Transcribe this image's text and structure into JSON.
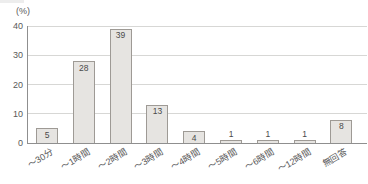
{
  "chart_data": {
    "type": "bar",
    "title": "",
    "unit_label": "(%)",
    "categories": [
      "〜30分",
      "〜1時間",
      "〜2時間",
      "〜3時間",
      "〜4時間",
      "〜5時間",
      "〜6時間",
      "〜12時間",
      "無回答"
    ],
    "values": [
      5,
      28,
      39,
      13,
      4,
      1,
      1,
      1,
      8
    ],
    "ylabel": "(%)",
    "xlabel": "",
    "ylim": [
      0,
      40
    ],
    "yticks": [
      0,
      10,
      20,
      30,
      40
    ],
    "grid": true,
    "legend": "none",
    "bar_color": "#e6e4e1",
    "bar_border_color": "#9e9a95",
    "gridline_color": "#d7d7d5",
    "axis_color": "#8f8f8f",
    "text_color": "#595959"
  }
}
